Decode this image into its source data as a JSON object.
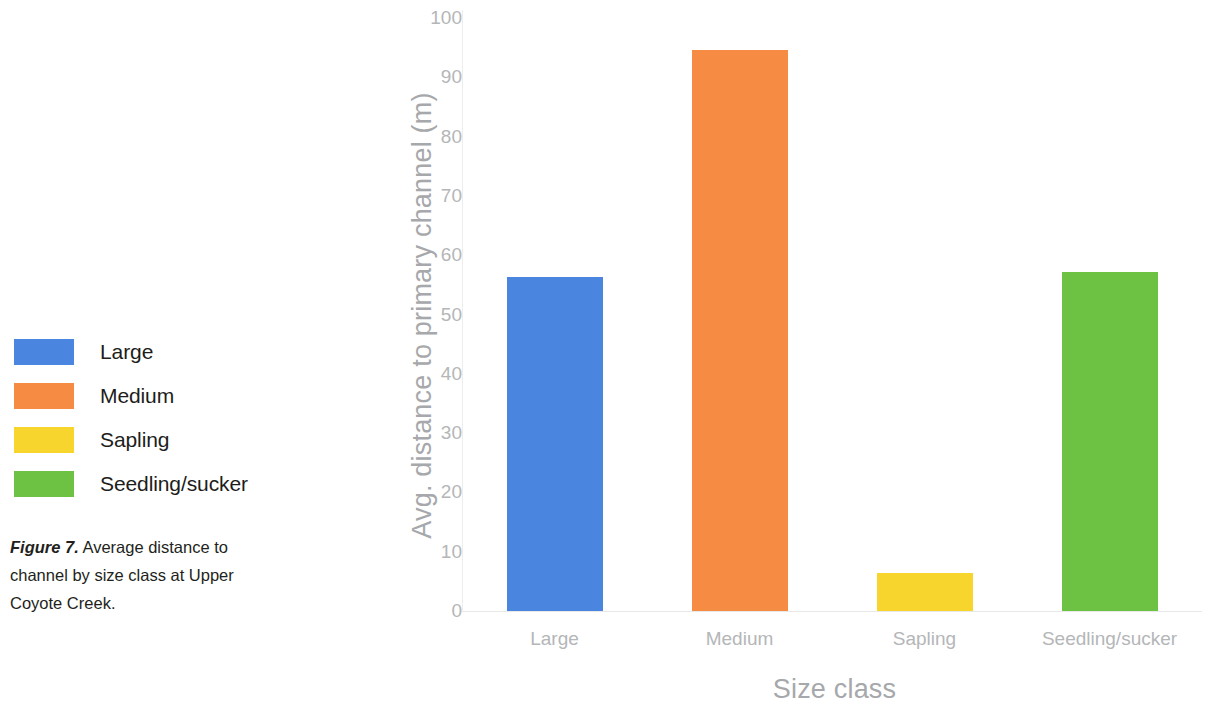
{
  "figure": {
    "caption_label": "Figure 7.",
    "caption_text": " Average distance to channel by size class at Upper Coyote Creek."
  },
  "legend": {
    "items": [
      {
        "label": "Large",
        "color": "#4a86e0"
      },
      {
        "label": "Medium",
        "color": "#f68c43"
      },
      {
        "label": "Sapling",
        "color": "#f7d52c"
      },
      {
        "label": "Seedling/sucker",
        "color": "#6dc243"
      }
    ]
  },
  "chart_data": {
    "type": "bar",
    "title": "",
    "subtitle": "",
    "xlabel": "Size class",
    "ylabel": "Avg. distance to primary channel (m)",
    "categories": [
      "Large",
      "Medium",
      "Sapling",
      "Seedling/sucker"
    ],
    "values": [
      56.4,
      94.6,
      6.4,
      57.2
    ],
    "colors": [
      "#4a86e0",
      "#f68c43",
      "#f7d52c",
      "#6dc243"
    ],
    "series": [
      {
        "name": "Avg. distance to primary channel (m)",
        "values": [
          56.4,
          94.6,
          6.4,
          57.2
        ]
      }
    ],
    "ylim": [
      0,
      100
    ],
    "yticks": [
      0,
      10,
      20,
      30,
      40,
      50,
      60,
      70,
      80,
      90,
      100
    ],
    "ytick_labels": [
      "0",
      "10",
      "20",
      "30",
      "40",
      "50",
      "60",
      "70",
      "80",
      "90",
      "100"
    ],
    "grid": false,
    "legend_position": "left-outside",
    "axis_color": "#b4b6b8",
    "label_color": "#a6a8ab"
  }
}
